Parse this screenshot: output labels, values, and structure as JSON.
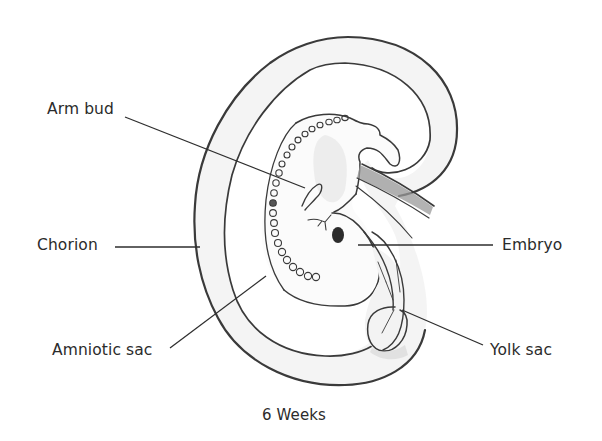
{
  "diagram": {
    "title": "6 Weeks",
    "labels": [
      {
        "id": "arm-bud",
        "text": "Arm bud",
        "side": "left"
      },
      {
        "id": "chorion",
        "text": "Chorion",
        "side": "left"
      },
      {
        "id": "amniotic-sac",
        "text": "Amniotic sac",
        "side": "left"
      },
      {
        "id": "embryo",
        "text": "Embryo",
        "side": "right"
      },
      {
        "id": "yolk-sac",
        "text": "Yolk sac",
        "side": "right"
      }
    ],
    "colors": {
      "ink": "#3a3a3a",
      "label_text": "#2b2b2b",
      "shading": "#d6d6d6",
      "background": "#ffffff"
    }
  }
}
